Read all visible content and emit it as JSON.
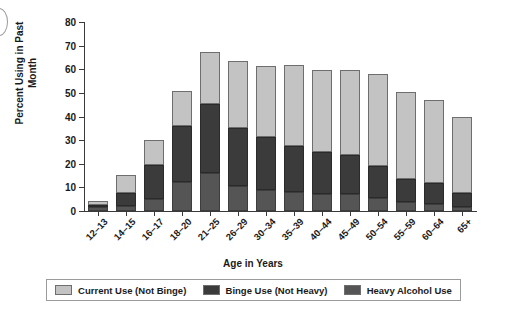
{
  "chart_data": {
    "type": "bar",
    "stacked": true,
    "title": "",
    "xlabel": "Age in Years",
    "ylabel": "Percent Using in Past Month",
    "ylim": [
      0,
      80
    ],
    "yticks": [
      0,
      10,
      20,
      30,
      40,
      50,
      60,
      70,
      80
    ],
    "grid": false,
    "legend_position": "bottom",
    "categories": [
      "12–13",
      "14–15",
      "16–17",
      "18–20",
      "21–25",
      "26–29",
      "30–34",
      "35–39",
      "40–44",
      "45–49",
      "50–54",
      "55–59",
      "60–64",
      "65+"
    ],
    "series": [
      {
        "name": "Heavy Alcohol Use",
        "color": "#555555",
        "values": [
          1.5,
          2.0,
          5.0,
          12.2,
          16.1,
          10.6,
          8.9,
          8.2,
          7.0,
          7.0,
          5.6,
          3.8,
          3.0,
          1.8
        ]
      },
      {
        "name": "Binge Use (Not Heavy)",
        "color": "#3b3b3b",
        "values": [
          1.1,
          5.8,
          14.5,
          23.6,
          29.4,
          24.6,
          22.4,
          19.2,
          18.1,
          16.7,
          13.6,
          9.8,
          9.0,
          5.7
        ]
      },
      {
        "name": "Current Use (Not Binge)",
        "color": "#c3c3c3",
        "values": [
          1.6,
          7.4,
          10.7,
          15.2,
          22.0,
          28.1,
          29.9,
          34.6,
          34.6,
          35.9,
          38.7,
          36.8,
          35.0,
          32.3
        ]
      }
    ],
    "totals": [
      4.2,
      15.2,
      30.2,
      51.0,
      67.5,
      63.3,
      61.2,
      62.0,
      59.7,
      59.6,
      57.9,
      50.4,
      47.0,
      39.8
    ],
    "annotations": []
  },
  "legend": {
    "items": [
      {
        "label": "Current Use (Not Binge)",
        "color": "#c3c3c3"
      },
      {
        "label": "Binge Use (Not Heavy)",
        "color": "#3b3b3b"
      },
      {
        "label": "Heavy Alcohol Use",
        "color": "#555555"
      }
    ]
  },
  "axes": {
    "y_title": "Percent Using in Past Month",
    "x_title": "Age in Years"
  }
}
